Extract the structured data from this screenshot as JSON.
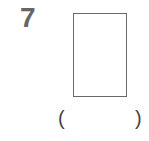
{
  "question": {
    "number": "7",
    "figure": "rectangle",
    "answer_open": "(",
    "answer_value": "",
    "answer_close": ")"
  },
  "colors": {
    "number": "#666666",
    "figure_stroke": "#6a6a6a"
  }
}
